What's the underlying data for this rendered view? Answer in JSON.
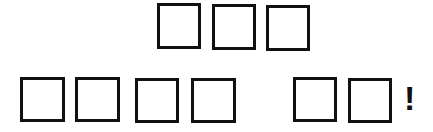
{
  "puzzle": {
    "rows": [
      {
        "name": "top-row",
        "boxes": [
          {
            "letter": "",
            "x": 157,
            "y": 3,
            "w": 44,
            "h": 46
          },
          {
            "letter": "",
            "x": 212,
            "y": 4,
            "w": 44,
            "h": 46
          },
          {
            "letter": "",
            "x": 266,
            "y": 5,
            "w": 44,
            "h": 46
          }
        ]
      },
      {
        "name": "bottom-row",
        "boxes": [
          {
            "letter": "",
            "x": 20,
            "y": 77,
            "w": 45,
            "h": 45
          },
          {
            "letter": "",
            "x": 75,
            "y": 77,
            "w": 45,
            "h": 45
          },
          {
            "letter": "",
            "x": 135,
            "y": 78,
            "w": 44,
            "h": 45
          },
          {
            "letter": "",
            "x": 191,
            "y": 78,
            "w": 45,
            "h": 45
          },
          {
            "letter": "",
            "x": 293,
            "y": 77,
            "w": 44,
            "h": 45
          },
          {
            "letter": "",
            "x": 348,
            "y": 78,
            "w": 44,
            "h": 45
          }
        ]
      }
    ],
    "punctuation": {
      "text": "!",
      "x": 404,
      "y": 81
    }
  },
  "colors": {
    "border": "#111111",
    "background": "#ffffff"
  }
}
